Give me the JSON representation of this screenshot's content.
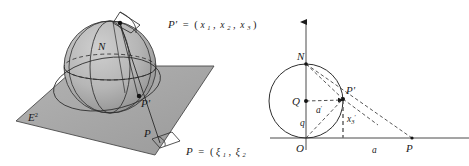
{
  "figure": {
    "background_color": "#ffffff",
    "ink_color": "#1b1b1b",
    "plane_fill_color": "#a8a8a8",
    "sphere_fill_color": "#b4b4b4",
    "left_panel": {
      "name": "3D stereographic projection from sphere to plane",
      "labels": {
        "north_pole": "N",
        "point_on_sphere": "P'",
        "point_in_plane_inner": "P",
        "point_in_plane_outer": "P",
        "plane_symbol": "E",
        "plane_superscript": "2",
        "sphere_point_equation_lhs": "P'",
        "sphere_point_equation_eq": "=",
        "sphere_point_equation_open": "(",
        "sphere_point_coord1": "x",
        "sphere_point_coord1_sub": "1",
        "sphere_point_comma1": ",",
        "sphere_point_coord2": "x",
        "sphere_point_coord2_sub": "2",
        "sphere_point_comma2": ",",
        "sphere_point_coord3": "x",
        "sphere_point_coord3_sub": "3",
        "sphere_point_equation_close": ")",
        "plane_point_equation_lhs": "P",
        "plane_point_equation_eq": "=",
        "plane_point_equation_open": "(",
        "plane_point_coord1": "ξ",
        "plane_point_coord1_sub": "1",
        "plane_point_comma1": ",",
        "plane_point_coord2": "ξ",
        "plane_point_coord2_sub": "2"
      }
    },
    "right_panel": {
      "name": "2D cross-section of stereographic projection",
      "labels": {
        "north_pole": "N",
        "center": "Q",
        "origin": "O",
        "point_on_circle": "P'",
        "point_on_axis": "P",
        "radius_label": "a",
        "radius_label_prime": "′",
        "chord_label": "q",
        "height_label": "x",
        "height_label_sub": "3",
        "height_label_prime": "′",
        "axis_distance_label": "a"
      },
      "geometry": {
        "origin_x": 306,
        "origin_y": 138,
        "center_x": 306,
        "center_y": 101,
        "radius": 37,
        "north_x": 306,
        "north_y": 64,
        "pprime_x": 343,
        "pprime_y": 99,
        "p_axis_x": 412,
        "p_axis_y": 138,
        "axis_left": 270,
        "axis_right": 469,
        "axis_top": 18
      }
    }
  }
}
